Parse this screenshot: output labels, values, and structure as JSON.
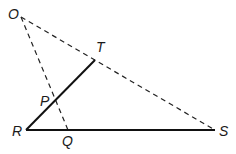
{
  "diagram": {
    "points": {
      "O": {
        "label": "O",
        "x": 21,
        "y": 17
      },
      "T": {
        "label": "T",
        "x": 95,
        "y": 60
      },
      "P": {
        "label": "P",
        "x": 55,
        "y": 101
      },
      "R": {
        "label": "R",
        "x": 26,
        "y": 130
      },
      "Q": {
        "label": "Q",
        "x": 68,
        "y": 130
      },
      "S": {
        "label": "S",
        "x": 215,
        "y": 130
      }
    },
    "segments": {
      "solid": [
        "R-T",
        "R-S"
      ],
      "dashed": [
        "O-S",
        "O-Q"
      ]
    }
  }
}
